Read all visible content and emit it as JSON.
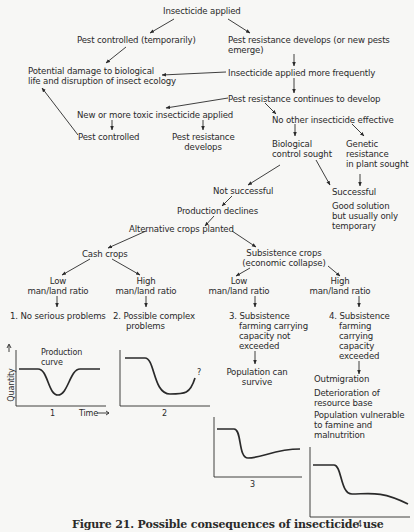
{
  "diagram": {
    "nodes": {
      "insecticide_applied": "Insecticide applied",
      "pest_controlled_temp": "Pest controlled (temporarily)",
      "pest_resistance_develops_1": "Pest resistance develops (or new pests",
      "pest_resistance_develops_2": "emerge)",
      "potential_damage_1": "Potential damage to biological",
      "potential_damage_2": "life and disruption of insect ecology",
      "applied_more_frequently": "Insecticide applied more frequently",
      "resistance_continues": "Pest resistance continues to develop",
      "new_toxic_insecticide": "New or more toxic insecticide applied",
      "no_other_effective": "No other insecticide effective",
      "pest_controlled": "Pest controlled",
      "pest_resistance_develops_short_1": "Pest resistance",
      "pest_resistance_develops_short_2": "develops",
      "biological_control_1": "Biological",
      "biological_control_2": "control sought",
      "genetic_resistance_1": "Genetic",
      "genetic_resistance_2": "resistance",
      "genetic_resistance_3": "in plant sought",
      "not_successful": "Not successful",
      "successful": "Successful",
      "good_solution_1": "Good solution",
      "good_solution_2": "but usually only",
      "good_solution_3": "temporary",
      "production_declines": "Production declines",
      "alternative_crops": "Alternative crops planted",
      "cash_crops": "Cash crops",
      "subsistence_crops_1": "Subsistence crops",
      "subsistence_crops_2": "(economic collapse)",
      "low_ratio_a_1": "Low",
      "low_ratio_a_2": "man/land ratio",
      "high_ratio_a_1": "High",
      "high_ratio_a_2": "man/land ratio",
      "low_ratio_b_1": "Low",
      "low_ratio_b_2": "man/land ratio",
      "high_ratio_b_1": "High",
      "high_ratio_b_2": "man/land ratio",
      "outcome_1": "1. No serious problems",
      "outcome_2_1": "2. Possible complex",
      "outcome_2_2": "problems",
      "outcome_3_1": "3. Subsistence",
      "outcome_3_2": "farming carrying",
      "outcome_3_3": "capacity not",
      "outcome_3_4": "exceeded",
      "outcome_4_1": "4. Subsistence",
      "outcome_4_2": "farming",
      "outcome_4_3": "carrying",
      "outcome_4_4": "capacity",
      "outcome_4_5": "exceeded",
      "population_survive_1": "Population can",
      "population_survive_2": "survive",
      "outmigration": "Outmigration",
      "deterioration_1": "Deterioration of",
      "deterioration_2": "resource base",
      "vulnerable_1": "Population vulnerable",
      "vulnerable_2": "to famine and",
      "vulnerable_3": "malnutrition"
    },
    "graphs": {
      "g1": {
        "label": "1",
        "curve_label_1": "Production",
        "curve_label_2": "curve",
        "y_axis": "Quantity",
        "x_axis": "Time"
      },
      "g2": {
        "label": "2",
        "annotation": "?"
      },
      "g3": {
        "label": "3"
      },
      "g4": {
        "label": "4"
      }
    },
    "caption": "Figure 21. Possible consequences of insecticide use"
  }
}
